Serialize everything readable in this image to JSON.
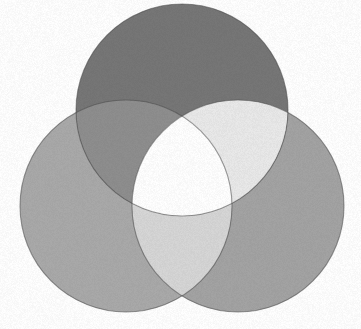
{
  "figure": {
    "background_color": "#ffffff",
    "width": 361,
    "height": 329,
    "texture": "film-grain",
    "outline_color": "#4a4a4a"
  },
  "chart_data": {
    "type": "venn",
    "subtitle": "",
    "xlabel": "",
    "ylabel": "",
    "set_count": 3,
    "background": "#ffffff",
    "sets": [
      {
        "name": "top",
        "label": "",
        "cx": 182,
        "cy": 110,
        "r": 106,
        "fill": "#767676",
        "tone": "dark gray"
      },
      {
        "name": "left",
        "label": "",
        "cx": 126,
        "cy": 206,
        "r": 106,
        "fill": "#a9a9a9",
        "tone": "medium gray"
      },
      {
        "name": "right",
        "label": "",
        "cx": 238,
        "cy": 206,
        "r": 106,
        "fill": "#a3a3a3",
        "tone": "medium gray"
      }
    ],
    "regions": [
      {
        "id": "top-only",
        "sets": [
          "top"
        ],
        "fill": "#767676",
        "tone": "dark gray"
      },
      {
        "id": "left-only",
        "sets": [
          "left"
        ],
        "fill": "#a9a9a9",
        "tone": "medium gray"
      },
      {
        "id": "right-only",
        "sets": [
          "right"
        ],
        "fill": "#a3a3a3",
        "tone": "medium gray"
      },
      {
        "id": "top-left",
        "sets": [
          "top",
          "left"
        ],
        "fill": "#8e8e8e",
        "tone": "mid gray"
      },
      {
        "id": "top-right",
        "sets": [
          "top",
          "right"
        ],
        "fill": "#e9e9e9",
        "tone": "near white"
      },
      {
        "id": "left-right",
        "sets": [
          "left",
          "right"
        ],
        "fill": "#d6d6d6",
        "tone": "light gray"
      },
      {
        "id": "all-three",
        "sets": [
          "top",
          "left",
          "right"
        ],
        "fill": "#ffffff",
        "tone": "white"
      }
    ],
    "legend_position": "none",
    "grid": false
  }
}
